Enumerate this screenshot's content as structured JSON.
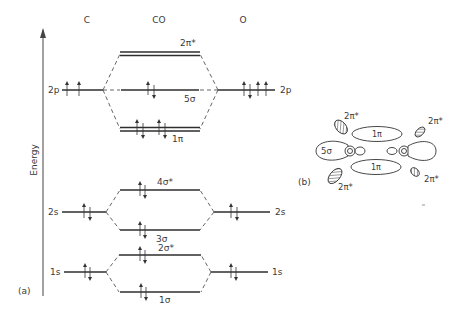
{
  "diagram": {
    "title_columns": {
      "left": "C",
      "middle": "CO",
      "right": "O"
    },
    "axis_label": "Energy",
    "panel_a_label": "(a)",
    "panel_b_label": "(b)",
    "atomic_levels": {
      "C": [
        {
          "name": "2p",
          "label": "2p",
          "electrons": "↑ ↑"
        },
        {
          "name": "2s",
          "label": "2s",
          "electrons": "↑↓"
        },
        {
          "name": "1s",
          "label": "1s",
          "electrons": "↑↓"
        }
      ],
      "O": [
        {
          "name": "2p",
          "label": "2p",
          "electrons": "↑↓ ↑ ↑"
        },
        {
          "name": "2s",
          "label": "2s",
          "electrons": "↑↓"
        },
        {
          "name": "1s",
          "label": "1s",
          "electrons": "↑↓"
        }
      ]
    },
    "molecular_orbitals": [
      {
        "name": "2pi-star",
        "label": "2π*",
        "electrons": "",
        "degenerate": true
      },
      {
        "name": "5sigma",
        "label": "5σ",
        "electrons": "↑↓",
        "degenerate": false
      },
      {
        "name": "1pi",
        "label": "1π",
        "electrons": "↑↓ ↑↓",
        "degenerate": true
      },
      {
        "name": "4sigma-star",
        "label": "4σ*",
        "electrons": "↑↓",
        "degenerate": false
      },
      {
        "name": "3sigma",
        "label": "3σ",
        "electrons": "↑↓",
        "degenerate": false
      },
      {
        "name": "2sigma-star",
        "label": "2σ*",
        "electrons": "↑↓",
        "degenerate": false
      },
      {
        "name": "1sigma",
        "label": "1σ",
        "electrons": "↑↓",
        "degenerate": false
      }
    ],
    "panel_b": {
      "labels": {
        "pi_star_tl": "2π*",
        "pi_star_tr": "2π*",
        "pi_star_bl": "2π*",
        "pi_star_br": "2π*",
        "pi_top": "1π",
        "pi_bottom": "1π",
        "sigma": "5σ",
        "atom_c": "C",
        "atom_o": "O"
      }
    }
  }
}
